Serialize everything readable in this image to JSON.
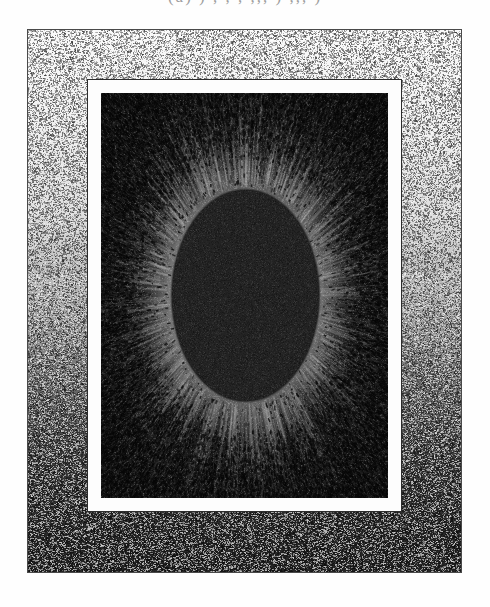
{
  "page": {
    "width": 490,
    "height": 607,
    "background_color": "#ffffff",
    "medium": "halftone stipple engraving (scanned plate)"
  },
  "caption": {
    "text": "(a) ) , , , ,,, ) ,,, )",
    "note": "line of text cropped at top edge; only descender tails visible",
    "color": "#8d8d8d"
  },
  "plate": {
    "name": "speckled mount / outer frame",
    "x": 27,
    "y": 29,
    "width": 435,
    "height": 544,
    "border_color": "#4a4a4a",
    "texture": "random speckle",
    "tone_gradient": "light at top, dark at bottom",
    "top_color": "#efefef",
    "bottom_color": "#2a2a2a"
  },
  "mat": {
    "name": "white mat border",
    "x": 88,
    "y": 80,
    "width": 313,
    "height": 431,
    "color": "#fdfdfd",
    "outline_color": "#2c2c2c",
    "thickness_px": 13
  },
  "field": {
    "name": "dark sky field",
    "x": 101,
    "y": 93,
    "width": 287,
    "height": 405,
    "color": "#1d1d1d"
  },
  "corona": {
    "name": "solar corona halo",
    "center_x": 245,
    "center_y": 295,
    "inner_radius_x": 74,
    "inner_radius_y": 106,
    "outer_radius_x": 140,
    "outer_radius_y": 178,
    "color": "#ffffff",
    "ray_count": 128,
    "rendering": "radial dashes fading outward into stipple"
  },
  "moon": {
    "name": "eclipsing moon disk",
    "x": 172,
    "y": 190,
    "width": 147,
    "height": 211,
    "center_x": 245,
    "center_y": 295,
    "color": "#232323",
    "shape": "ellipse"
  },
  "subject": {
    "title": "Total solar eclipse corona",
    "description": "A dark elliptical disk surrounded by a bright radiating corona set against a dark sky field, mounted with a white mat inside a speckled frame."
  },
  "colors": {
    "white": "#ffffff",
    "mat": "#fdfdfd",
    "field_dark": "#1d1d1d",
    "moon_dark": "#232323",
    "frame_line": "#4a4a4a",
    "caption_gray": "#8d8d8d"
  }
}
